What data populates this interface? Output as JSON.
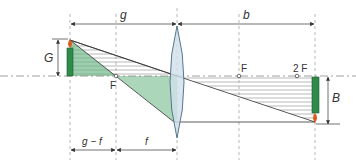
{
  "diagram": {
    "type": "thin-lens-image-formation",
    "labels": {
      "object_distance": "g",
      "image_distance": "b",
      "object_size": "G",
      "image_size": "B",
      "focal_left": "F",
      "focal_right": "F",
      "double_focal_right": "2 F",
      "g_minus_f": "g − f",
      "focal_length": "f"
    },
    "colors": {
      "object_candle": "#2e8b4a",
      "flame": "#e05a1a",
      "lens_fill": "#cfe0ea",
      "lens_stroke": "#4a6a80",
      "green_region": "#9ccfae",
      "hatch_lines": "#999999",
      "axis_dash": "#888888",
      "ray_line": "#333333"
    }
  }
}
